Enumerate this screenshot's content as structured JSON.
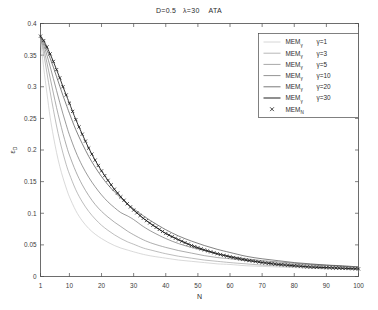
{
  "chart_data": {
    "type": "line",
    "title": "D=0.5   λ=30    ATA",
    "xlabel": "N",
    "ylabel": "ε_D",
    "xlim": [
      1,
      100
    ],
    "ylim": [
      0,
      0.4
    ],
    "xticks": [
      1,
      10,
      20,
      30,
      40,
      50,
      60,
      70,
      80,
      90,
      100
    ],
    "xticklabels": [
      "1",
      "10",
      "20",
      "30",
      "40",
      "50",
      "60",
      "70",
      "80",
      "90",
      "100"
    ],
    "yticks": [
      0,
      0.05,
      0.1,
      0.15,
      0.2,
      0.25,
      0.3,
      0.35,
      0.4
    ],
    "yticklabels": [
      "0",
      "0.05",
      "0.1",
      "0.15",
      "0.2",
      "0.25",
      "0.3",
      "0.35",
      "0.4"
    ],
    "grid": false,
    "legend_position": "upper right",
    "legend_entries": [
      {
        "base": "MEM",
        "sub": "γ",
        "value": "γ=1",
        "style": "line",
        "color": "#c8c8c8"
      },
      {
        "base": "MEM",
        "sub": "γ",
        "value": "γ=3",
        "style": "line",
        "color": "#a0a0a0"
      },
      {
        "base": "MEM",
        "sub": "γ",
        "value": "γ=5",
        "style": "line",
        "color": "#8a8a8a"
      },
      {
        "base": "MEM",
        "sub": "γ",
        "value": "γ=10",
        "style": "line",
        "color": "#707070"
      },
      {
        "base": "MEM",
        "sub": "γ",
        "value": "γ=20",
        "style": "line",
        "color": "#4e4e4e"
      },
      {
        "base": "MEM",
        "sub": "γ",
        "value": "γ=30",
        "style": "line",
        "color": "#2a2a2a"
      },
      {
        "base": "MEM",
        "sub": "N",
        "value": "",
        "style": "marker",
        "color": "#1a1a1a"
      }
    ],
    "x": [
      1,
      2,
      3,
      4,
      5,
      6,
      7,
      8,
      9,
      10,
      12,
      14,
      16,
      18,
      20,
      22,
      24,
      26,
      28,
      30,
      33,
      36,
      40,
      44,
      48,
      52,
      56,
      60,
      65,
      70,
      75,
      80,
      85,
      90,
      95,
      100
    ],
    "series": [
      {
        "name": "MEM_γ γ=1",
        "color": "#c8c8c8",
        "values": [
          0.375,
          0.33,
          0.29,
          0.252,
          0.222,
          0.196,
          0.174,
          0.156,
          0.14,
          0.126,
          0.104,
          0.088,
          0.076,
          0.067,
          0.06,
          0.054,
          0.049,
          0.045,
          0.042,
          0.039,
          0.035,
          0.032,
          0.029,
          0.026,
          0.024,
          0.022,
          0.02,
          0.019,
          0.017,
          0.016,
          0.015,
          0.014,
          0.013,
          0.012,
          0.012,
          0.011
        ]
      },
      {
        "name": "MEM_γ γ=3",
        "color": "#a0a0a0",
        "values": [
          0.376,
          0.352,
          0.322,
          0.292,
          0.264,
          0.238,
          0.215,
          0.195,
          0.177,
          0.162,
          0.137,
          0.118,
          0.103,
          0.091,
          0.081,
          0.073,
          0.066,
          0.06,
          0.055,
          0.051,
          0.045,
          0.041,
          0.036,
          0.032,
          0.029,
          0.026,
          0.024,
          0.022,
          0.02,
          0.018,
          0.017,
          0.016,
          0.015,
          0.014,
          0.013,
          0.012
        ]
      },
      {
        "name": "MEM_γ γ=5",
        "color": "#8a8a8a",
        "values": [
          0.377,
          0.36,
          0.338,
          0.314,
          0.29,
          0.267,
          0.246,
          0.226,
          0.208,
          0.192,
          0.166,
          0.145,
          0.128,
          0.114,
          0.103,
          0.094,
          0.086,
          0.079,
          0.072,
          0.066,
          0.058,
          0.052,
          0.046,
          0.041,
          0.037,
          0.033,
          0.03,
          0.028,
          0.025,
          0.023,
          0.021,
          0.019,
          0.018,
          0.017,
          0.016,
          0.015
        ]
      },
      {
        "name": "MEM_γ γ=10",
        "color": "#707070",
        "values": [
          0.378,
          0.366,
          0.35,
          0.332,
          0.313,
          0.294,
          0.275,
          0.257,
          0.24,
          0.224,
          0.197,
          0.175,
          0.157,
          0.142,
          0.129,
          0.118,
          0.109,
          0.101,
          0.096,
          0.09,
          0.079,
          0.07,
          0.06,
          0.052,
          0.046,
          0.041,
          0.036,
          0.032,
          0.028,
          0.025,
          0.023,
          0.021,
          0.019,
          0.018,
          0.016,
          0.015
        ]
      },
      {
        "name": "MEM_γ γ=20",
        "color": "#4e4e4e",
        "values": [
          0.379,
          0.37,
          0.358,
          0.345,
          0.331,
          0.316,
          0.301,
          0.286,
          0.272,
          0.258,
          0.232,
          0.21,
          0.19,
          0.173,
          0.158,
          0.145,
          0.134,
          0.124,
          0.115,
          0.107,
          0.096,
          0.086,
          0.074,
          0.064,
          0.056,
          0.049,
          0.043,
          0.038,
          0.032,
          0.028,
          0.025,
          0.022,
          0.02,
          0.018,
          0.017,
          0.015
        ]
      },
      {
        "name": "MEM_γ γ=30",
        "color": "#2a2a2a",
        "values": [
          0.38,
          0.373,
          0.363,
          0.352,
          0.34,
          0.327,
          0.314,
          0.3,
          0.287,
          0.274,
          0.248,
          0.225,
          0.203,
          0.184,
          0.167,
          0.152,
          0.138,
          0.126,
          0.115,
          0.105,
          0.092,
          0.081,
          0.068,
          0.058,
          0.049,
          0.042,
          0.036,
          0.031,
          0.026,
          0.022,
          0.019,
          0.017,
          0.015,
          0.014,
          0.013,
          0.012
        ]
      },
      {
        "name": "MEM_N",
        "color": "#1a1a1a",
        "marker": "x",
        "values": [
          0.38,
          0.373,
          0.363,
          0.352,
          0.34,
          0.327,
          0.314,
          0.3,
          0.287,
          0.274,
          0.248,
          0.225,
          0.203,
          0.184,
          0.167,
          0.152,
          0.138,
          0.126,
          0.115,
          0.105,
          0.092,
          0.081,
          0.068,
          0.058,
          0.049,
          0.042,
          0.036,
          0.031,
          0.026,
          0.022,
          0.019,
          0.017,
          0.015,
          0.014,
          0.013,
          0.012
        ]
      }
    ]
  }
}
